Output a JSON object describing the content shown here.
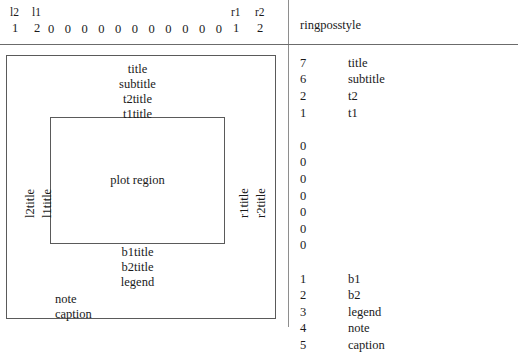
{
  "index_header": {
    "left_labels": [
      {
        "name": "l2",
        "value": "1"
      },
      {
        "name": "l1",
        "value": "2"
      }
    ],
    "middle_values": [
      "0",
      "0",
      "0",
      "0",
      "0",
      "0",
      "0",
      "0",
      "0",
      "0",
      "0"
    ],
    "right_labels": [
      {
        "name": "r1",
        "value": "1"
      },
      {
        "name": "r2",
        "value": "2"
      }
    ]
  },
  "right_pane": {
    "title": "ringposstyle",
    "rows": [
      {
        "num": "7",
        "label": "title"
      },
      {
        "num": "6",
        "label": "subtitle"
      },
      {
        "num": "2",
        "label": "t2"
      },
      {
        "num": "1",
        "label": "t1"
      },
      {
        "num": "",
        "label": ""
      },
      {
        "num": "0",
        "label": ""
      },
      {
        "num": "0",
        "label": ""
      },
      {
        "num": "0",
        "label": ""
      },
      {
        "num": "0",
        "label": ""
      },
      {
        "num": "0",
        "label": ""
      },
      {
        "num": "0",
        "label": ""
      },
      {
        "num": "0",
        "label": ""
      },
      {
        "num": "",
        "label": ""
      },
      {
        "num": "1",
        "label": "b1"
      },
      {
        "num": "2",
        "label": "b2"
      },
      {
        "num": "3",
        "label": "legend"
      },
      {
        "num": "4",
        "label": "note"
      },
      {
        "num": "5",
        "label": "caption"
      }
    ]
  },
  "diagram": {
    "plot_region": "plot region",
    "top_labels": [
      "title",
      "subtitle",
      "t2title",
      "t1title"
    ],
    "bottom_labels": [
      "b1title",
      "b2title",
      "legend"
    ],
    "corner_labels": [
      "note",
      "caption"
    ],
    "left_labels": [
      "l2title",
      "l1title"
    ],
    "right_labels": [
      "r1title",
      "r2title"
    ]
  }
}
